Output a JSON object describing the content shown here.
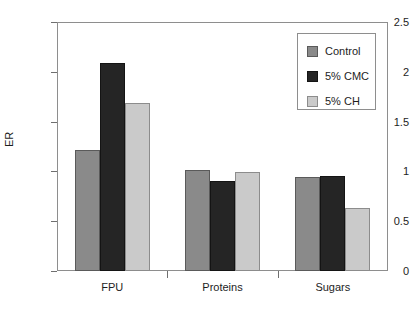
{
  "chart_data": {
    "type": "bar",
    "title": "",
    "xlabel": "",
    "ylabel": "ER",
    "categories": [
      "FPU",
      "Proteins",
      "Sugars"
    ],
    "series": [
      {
        "name": "Control",
        "color": "#8a8a8a",
        "values": [
          1.21,
          1.01,
          0.94
        ]
      },
      {
        "name": "5% CMC",
        "color": "#252525",
        "values": [
          2.09,
          0.9,
          0.95
        ]
      },
      {
        "name": "5% CH",
        "color": "#cacaca",
        "values": [
          1.69,
          0.99,
          0.63
        ]
      }
    ],
    "ylim": [
      0,
      2.5
    ],
    "yticks": [
      0,
      0.5,
      1,
      1.5,
      2,
      2.5
    ],
    "ytick_labels": [
      "0",
      "0.5",
      "1",
      "1.5",
      "2",
      "2.5"
    ],
    "grid": false,
    "legend_position": "upper-right",
    "frame": true
  }
}
